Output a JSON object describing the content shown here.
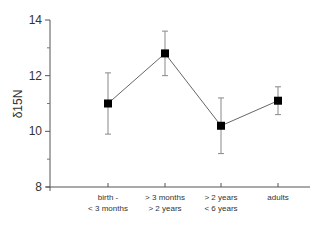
{
  "chart_data": {
    "type": "line",
    "title": "",
    "xlabel": "",
    "ylabel": "δ15N",
    "ylim": [
      8,
      14
    ],
    "yticks": [
      8,
      10,
      12,
      14
    ],
    "y_minor_ticks": [
      9,
      11,
      13
    ],
    "grid": false,
    "legend": null,
    "categories": [
      [
        "birth -",
        "< 3 months"
      ],
      [
        "> 3 months",
        "> 2 years"
      ],
      [
        "> 2 years",
        "< 6 years"
      ],
      [
        "adults"
      ]
    ],
    "series": [
      {
        "name": "δ15N mean",
        "values": [
          11.0,
          12.8,
          10.2,
          11.1
        ],
        "error_upper": [
          12.1,
          13.6,
          11.2,
          11.6
        ],
        "error_lower": [
          9.9,
          12.0,
          9.2,
          10.6
        ],
        "marker": "square",
        "color": "#000000",
        "line_color": "#666666"
      }
    ]
  }
}
